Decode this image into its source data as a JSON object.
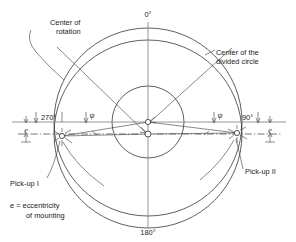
{
  "figure": {
    "type": "technical-diagram"
  },
  "angle_labels": {
    "top": "0°",
    "bottom": "180°",
    "left": "270°",
    "right": "90°"
  },
  "callouts": {
    "center_of_rotation_line1": "Center of",
    "center_of_rotation_line2": "rotation",
    "center_of_divided_circle_line1": "Center of the",
    "center_of_divided_circle_line2": "divided circle",
    "pickup_one": "Pick-up I",
    "pickup_two": "Pick-up II"
  },
  "legend": {
    "line1": "e = eccentricity",
    "line2": "of mounting"
  },
  "symbols": {
    "eccentricity_left": "e",
    "eccentricity_right": "e",
    "psi_left": "ψ",
    "psi_right": "ψ"
  },
  "geometry": {
    "outer_circle_rotation": {
      "cx": 148,
      "cy": 134,
      "r": 94
    },
    "outer_circle_divided": {
      "cx": 148,
      "cy": 122,
      "r": 94
    },
    "inner_circle": {
      "cx": 148,
      "cy": 122,
      "r": 36
    },
    "center_of_rotation_point": {
      "x": 148,
      "y": 134
    },
    "center_of_divided_circle_point": {
      "x": 148,
      "y": 122
    },
    "pickup_one_point": {
      "x": 62,
      "y": 136
    },
    "pickup_two_point": {
      "x": 237,
      "y": 133
    },
    "datum_line_y": 122,
    "chain_line_y": 134
  },
  "colors": {
    "line": "#2b2b2b",
    "axis": "#8a8a8a",
    "text": "#1a1a1a",
    "background": "#ffffff"
  }
}
